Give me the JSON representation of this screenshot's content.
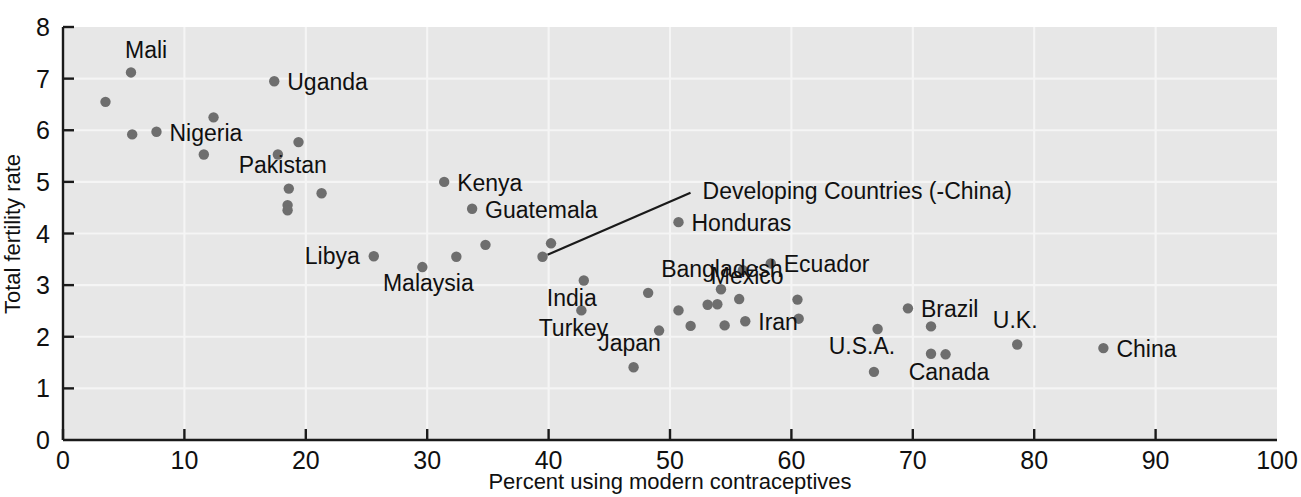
{
  "chart_data": {
    "type": "scatter",
    "title": "",
    "xlabel": "Percent using modern contraceptives",
    "ylabel": "Total fertility rate",
    "xlim": [
      0,
      100
    ],
    "ylim": [
      0,
      8
    ],
    "xticks": [
      0,
      10,
      20,
      30,
      40,
      50,
      60,
      70,
      80,
      90,
      100
    ],
    "yticks": [
      0,
      1,
      2,
      3,
      4,
      5,
      6,
      7,
      8
    ],
    "grid": true,
    "legend": "none",
    "marker_color": "#6e6e6e",
    "background_color": "#e7e7e7",
    "gridline_color": "#f7f7f7",
    "axis_color": "#1a1a1a",
    "points": [
      {
        "label": "",
        "x": 3.5,
        "y": 6.55
      },
      {
        "label": "Mali",
        "x": 5.6,
        "y": 7.12,
        "label_dx": -6,
        "label_dy": -14,
        "anchor": "start"
      },
      {
        "label": "",
        "x": 5.7,
        "y": 5.92
      },
      {
        "label": "Nigeria",
        "x": 7.7,
        "y": 5.97,
        "label_dx": 13,
        "label_dy": 9,
        "anchor": "start"
      },
      {
        "label": "",
        "x": 11.6,
        "y": 5.53
      },
      {
        "label": "",
        "x": 12.4,
        "y": 6.25
      },
      {
        "label": "Uganda",
        "x": 17.4,
        "y": 6.95,
        "label_dx": 13,
        "label_dy": 9,
        "anchor": "start"
      },
      {
        "label": "",
        "x": 17.7,
        "y": 5.53
      },
      {
        "label": "",
        "x": 19.4,
        "y": 5.77
      },
      {
        "label": "Pakistan",
        "x": 18.6,
        "y": 4.87,
        "label_dx": -6,
        "label_dy": -16,
        "anchor": "middle"
      },
      {
        "label": "",
        "x": 18.5,
        "y": 4.55
      },
      {
        "label": "",
        "x": 18.5,
        "y": 4.45
      },
      {
        "label": "",
        "x": 21.3,
        "y": 4.78
      },
      {
        "label": "Libya",
        "x": 25.6,
        "y": 3.56,
        "label_dx": -14,
        "label_dy": 8,
        "anchor": "end"
      },
      {
        "label": "Malaysia",
        "x": 29.6,
        "y": 3.35,
        "label_dx": 6,
        "label_dy": 24,
        "anchor": "middle"
      },
      {
        "label": "Kenya",
        "x": 31.4,
        "y": 5.0,
        "label_dx": 13,
        "label_dy": 9,
        "anchor": "start"
      },
      {
        "label": "",
        "x": 32.4,
        "y": 3.55
      },
      {
        "label": "Guatemala",
        "x": 33.7,
        "y": 4.48,
        "label_dx": 13,
        "label_dy": 9,
        "anchor": "start"
      },
      {
        "label": "",
        "x": 34.8,
        "y": 3.78
      },
      {
        "label": "Developing Countries (-China)",
        "x": 39.5,
        "y": 3.55,
        "leader": true,
        "label_dx": 160,
        "label_dy": -58,
        "anchor": "start"
      },
      {
        "label": "",
        "x": 40.2,
        "y": 3.81
      },
      {
        "label": "India",
        "x": 42.9,
        "y": 3.09,
        "label_dx": -12,
        "label_dy": 26,
        "anchor": "middle"
      },
      {
        "label": "Turkey",
        "x": 42.7,
        "y": 2.51,
        "label_dx": -8,
        "label_dy": 26,
        "anchor": "middle"
      },
      {
        "label": "Japan",
        "x": 47.0,
        "y": 1.41,
        "label_dx": -4,
        "label_dy": -16,
        "anchor": "middle"
      },
      {
        "label": "Bangladesh",
        "x": 48.2,
        "y": 2.85,
        "label_dx": 13,
        "label_dy": -16,
        "anchor": "start"
      },
      {
        "label": "",
        "x": 49.1,
        "y": 2.12
      },
      {
        "label": "Honduras",
        "x": 50.7,
        "y": 4.22,
        "label_dx": 13,
        "label_dy": 9,
        "anchor": "start"
      },
      {
        "label": "",
        "x": 50.7,
        "y": 2.51
      },
      {
        "label": "",
        "x": 51.7,
        "y": 2.21
      },
      {
        "label": "",
        "x": 53.1,
        "y": 2.62
      },
      {
        "label": "",
        "x": 53.9,
        "y": 2.63
      },
      {
        "label": "",
        "x": 54.2,
        "y": 2.92
      },
      {
        "label": "",
        "x": 54.5,
        "y": 2.22
      },
      {
        "label": "Mexico",
        "x": 55.7,
        "y": 2.73,
        "label_dx": 8,
        "label_dy": -15,
        "anchor": "middle"
      },
      {
        "label": "",
        "x": 56.0,
        "y": 3.29
      },
      {
        "label": "Iran",
        "x": 56.2,
        "y": 2.3,
        "label_dx": 13,
        "label_dy": 9,
        "anchor": "start"
      },
      {
        "label": "Ecuador",
        "x": 58.3,
        "y": 3.42,
        "label_dx": 13,
        "label_dy": 9,
        "anchor": "start"
      },
      {
        "label": "",
        "x": 60.5,
        "y": 2.72
      },
      {
        "label": "",
        "x": 60.6,
        "y": 2.35
      },
      {
        "label": "U.S.A.",
        "x": 66.8,
        "y": 1.32,
        "label_dx": -12,
        "label_dy": -18,
        "anchor": "middle"
      },
      {
        "label": "",
        "x": 67.1,
        "y": 2.15
      },
      {
        "label": "Brazil",
        "x": 69.6,
        "y": 2.55,
        "label_dx": 13,
        "label_dy": 9,
        "anchor": "start"
      },
      {
        "label": "",
        "x": 71.5,
        "y": 2.2
      },
      {
        "label": "Canada",
        "x": 71.5,
        "y": 1.67,
        "label_dx": 18,
        "label_dy": 26,
        "anchor": "middle"
      },
      {
        "label": "",
        "x": 72.7,
        "y": 1.66
      },
      {
        "label": "U.K.",
        "x": 78.6,
        "y": 1.85,
        "label_dx": -2,
        "label_dy": -16,
        "anchor": "middle"
      },
      {
        "label": "China",
        "x": 85.7,
        "y": 1.78,
        "label_dx": 13,
        "label_dy": 9,
        "anchor": "start"
      }
    ]
  }
}
